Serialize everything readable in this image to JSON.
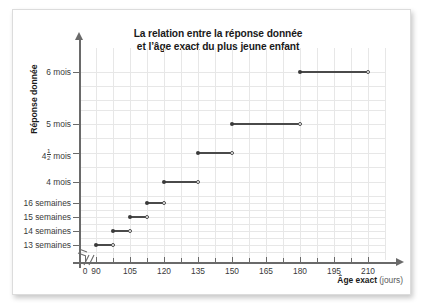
{
  "figure": {
    "title_line1": "La relation entre la réponse donnée",
    "title_line2": "et l’âge exact du plus jeune enfant",
    "y_axis_title": "Réponse donnée",
    "x_axis_title_bold": "Âge exact",
    "x_axis_title_unit": "(jours)",
    "axis_break_marker": "//"
  },
  "chart_data": {
    "type": "line",
    "title": "La relation entre la réponse donnée et l’âge exact du plus jeune enfant",
    "subtitle": "",
    "xlabel": "Âge exact (jours)",
    "ylabel": "Réponse donnée",
    "xlim": [
      82.5,
      217.5
    ],
    "xticks": [
      0,
      90,
      105,
      120,
      135,
      150,
      165,
      180,
      195,
      210
    ],
    "xtick_labels": [
      "0",
      "90",
      "105",
      "120",
      "135",
      "150",
      "165",
      "180",
      "195",
      "210"
    ],
    "x_minor_tick_step": 7.5,
    "x_axis_break_after": "0",
    "yticks": [
      1,
      2,
      3,
      4,
      5,
      6,
      7,
      8
    ],
    "ytick_labels": [
      "13 semaines",
      "14 semaines",
      "15 semaines",
      "16 semaines",
      "4 mois",
      "4½ mois",
      "5 mois",
      "6 mois"
    ],
    "grid": true,
    "legend": "none",
    "series": [
      {
        "name": "Réponse donnée (fonction en escalier)",
        "step_segments": [
          {
            "label": "13 semaines",
            "y_index": 1,
            "x_start": 90,
            "x_end": 97.5,
            "left_endpoint": "closed",
            "right_endpoint": "open"
          },
          {
            "label": "14 semaines",
            "y_index": 2,
            "x_start": 97.5,
            "x_end": 105,
            "left_endpoint": "closed",
            "right_endpoint": "open"
          },
          {
            "label": "15 semaines",
            "y_index": 3,
            "x_start": 105,
            "x_end": 112.5,
            "left_endpoint": "closed",
            "right_endpoint": "open"
          },
          {
            "label": "16 semaines",
            "y_index": 4,
            "x_start": 112.5,
            "x_end": 120,
            "left_endpoint": "closed",
            "right_endpoint": "open"
          },
          {
            "label": "4 mois",
            "y_index": 5,
            "x_start": 120,
            "x_end": 135,
            "left_endpoint": "closed",
            "right_endpoint": "open"
          },
          {
            "label": "4½ mois",
            "y_index": 6,
            "x_start": 135,
            "x_end": 150,
            "left_endpoint": "closed",
            "right_endpoint": "open"
          },
          {
            "label": "5 mois",
            "y_index": 7,
            "x_start": 150,
            "x_end": 180,
            "left_endpoint": "closed",
            "right_endpoint": "open"
          },
          {
            "label": "6 mois",
            "y_index": 8,
            "x_start": 180,
            "x_end": 210,
            "left_endpoint": "closed",
            "right_endpoint": "open"
          }
        ]
      }
    ],
    "colors": {
      "line": "#4a4a4a",
      "marker_filled": "#3a3a3a",
      "marker_open_edge": "#4a4a4a",
      "grid": "#e7e7e7",
      "axis": "#6a6a6a",
      "text": "#1a1a1a"
    }
  }
}
